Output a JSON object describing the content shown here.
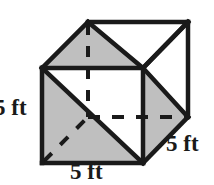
{
  "figure": {
    "name": "cube-net-diagram",
    "shape": "cube",
    "colors": {
      "edge": "#1a1a1a",
      "shaded_face": "#bfbfbf",
      "unshaded_face": "#ffffff",
      "background": "#ffffff",
      "label_text": "#1a1a1a"
    },
    "labels": {
      "left_edge": "5 ft",
      "bottom_edge": "5 ft",
      "right_edge": "5 ft"
    },
    "units": "ft",
    "edge_length": 5,
    "geometry": {
      "front_face": [
        [
          42,
          68
        ],
        [
          143,
          68
        ],
        [
          143,
          163
        ],
        [
          42,
          163
        ]
      ],
      "back_face": [
        [
          88,
          22
        ],
        [
          188,
          22
        ],
        [
          188,
          117
        ],
        [
          88,
          117
        ]
      ],
      "depth_offset": [
        46,
        -46
      ],
      "hidden_vertex": [
        88,
        117
      ],
      "shaded_regions": [
        "top-face-left-triangle",
        "left-face",
        "front-face-lower-left-triangle",
        "right-face-middle-triangle"
      ],
      "dashed_edges": [
        [
          [
            88,
            22
          ],
          [
            88,
            117
          ]
        ],
        [
          [
            88,
            117
          ],
          [
            188,
            117
          ]
        ],
        [
          [
            42,
            163
          ],
          [
            88,
            117
          ]
        ]
      ]
    }
  }
}
